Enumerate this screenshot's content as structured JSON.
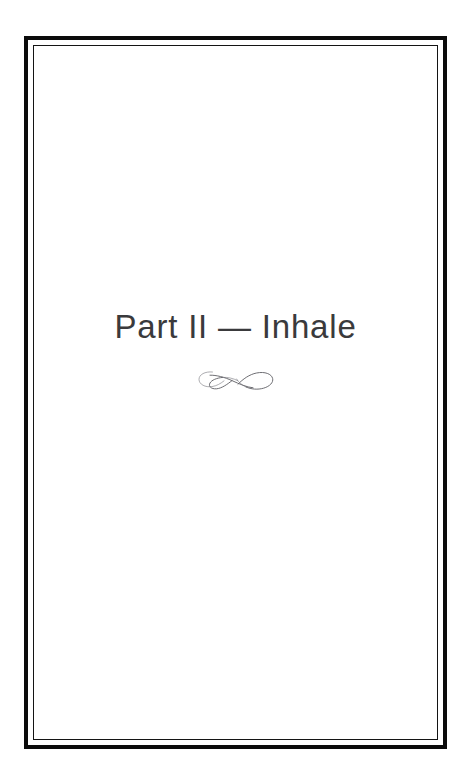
{
  "page": {
    "type": "book-part-title-page",
    "background_color": "#ffffff",
    "frame": {
      "style": "double-rule",
      "outer_rule_color": "#0b0b0b",
      "inner_rule_color": "#141414"
    }
  },
  "title": {
    "text": "Part II — Inhale",
    "part_label": "Part II",
    "separator": "—",
    "part_name": "Inhale",
    "color": "#3a3a3c"
  },
  "ornament": {
    "name": "calligraphic-flourish-ornament",
    "description": "infinity-style double loop flourish with crescent tail",
    "color": "#5d5d63"
  }
}
